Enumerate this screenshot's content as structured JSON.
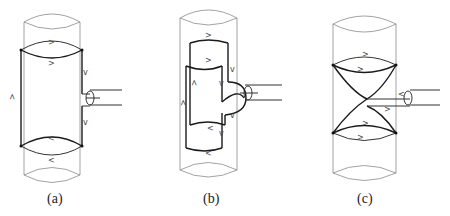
{
  "figure": {
    "panels": [
      {
        "id": "a",
        "caption": "(a)",
        "description": "Cylinder with rectangular loop spanning full height, coupled via loop at right edge"
      },
      {
        "id": "b",
        "caption": "(b)",
        "description": "Cylinder with two overlapping partial loops and semicircular coupling at right"
      },
      {
        "id": "c",
        "caption": "(c)",
        "description": "Cylinder with crossed (hourglass/figure-eight) loop, coupled at crossing point"
      }
    ],
    "arrows": {
      "right": ">",
      "left": "<",
      "up": "^",
      "down": "v"
    }
  }
}
